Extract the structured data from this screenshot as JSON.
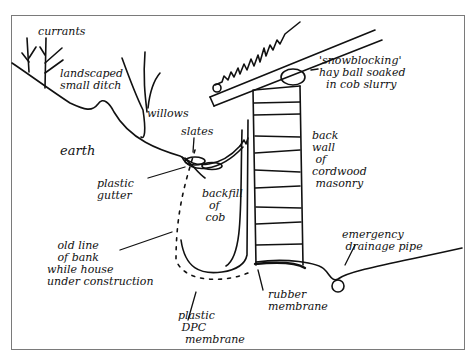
{
  "diagram": {
    "type": "hand-drawn cross-section sketch",
    "stroke_color": "#111111",
    "frame_color": "#7a7a7a",
    "labels": {
      "currants": "currants",
      "landscaped_ditch": "landscaped\nsmall ditch",
      "willows": "willows",
      "snowblocking": "'snowblocking'\nhay ball soaked\n  in cob slurry",
      "slates": "slates",
      "earth": "earth",
      "back_wall": "back\nwall\n of\ncordwood\n masonry",
      "plastic_gutter": "plastic\ngutter",
      "backfill": "backfill\n  of\n cob",
      "old_line": "   old line\n   of bank\nwhile house\nunder construction",
      "emergency_pipe": "emergency\n drainage pipe",
      "rubber_membrane": "rubber\nmembrane",
      "dpc_membrane": "plastic\n DPC\n  membrane"
    }
  }
}
